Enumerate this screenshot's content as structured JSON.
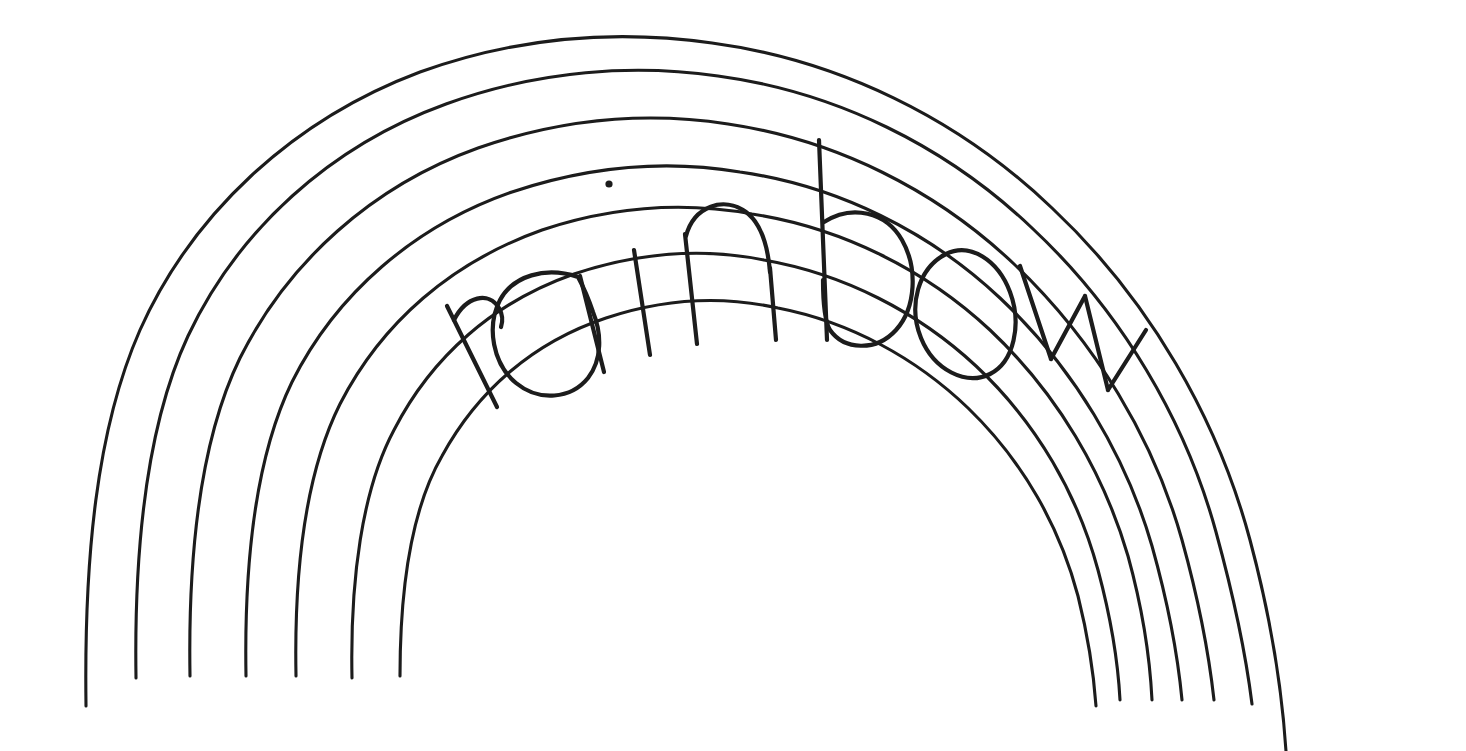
{
  "artwork": {
    "title": "rainbow",
    "kind": "hand-drawn line sketch",
    "medium": "black ink pen on white paper",
    "lettered_word": "rainbow",
    "letters": [
      "r",
      "a",
      "i",
      "n",
      "b",
      "o",
      "w"
    ],
    "letter_count": 7,
    "description": "A hand-drawn rainbow of seven concentric semicircular arcs with the word rainbow hand-lettered inside one of the bands, following the curve of the arch.",
    "background_color": "#ffffff",
    "ink_color": "#1c1c1c",
    "stroke_width_px": 3,
    "letter_stroke_width_px": 4,
    "canvas": {
      "width": 1466,
      "height": 751
    }
  },
  "rainbow": {
    "arc_count": 7,
    "center": {
      "x": 770,
      "y": 712
    },
    "arcs": [
      {
        "index": 1,
        "name": "arc-outer-1",
        "radius": 670,
        "apex_y": 43,
        "note": "outermost arc"
      },
      {
        "index": 2,
        "name": "arc-2",
        "radius": 620,
        "apex_y": 93,
        "note": ""
      },
      {
        "index": 3,
        "name": "arc-3",
        "radius": 574,
        "apex_y": 137,
        "note": "top of b ascender touches here"
      },
      {
        "index": 4,
        "name": "arc-4",
        "radius": 524,
        "apex_y": 188,
        "note": "cap line of lettering band"
      },
      {
        "index": 5,
        "name": "arc-5-letter-top",
        "radius": 476,
        "apex_y": 236,
        "note": "x-height line of lettering band"
      },
      {
        "index": 6,
        "name": "arc-6-letter-base",
        "radius": 418,
        "apex_y": 295,
        "note": "baseline of lettering band"
      },
      {
        "index": 7,
        "name": "arc-inner-7",
        "radius": 364,
        "apex_y": 348,
        "note": "innermost arc"
      }
    ],
    "lettering_band": {
      "between_arcs": [
        5,
        6
      ],
      "word": "rainbow",
      "orientation": "follows the arc curvature, letters rotate with the arch"
    },
    "artifacts": [
      {
        "name": "ink-dot",
        "x": 609,
        "y": 184,
        "radius": 3.5,
        "note": "stray pen dot above the lettering"
      }
    ]
  },
  "labels": {
    "alt_text": "Hand-drawn rainbow sketch with the word rainbow lettered inside an arc band",
    "word_label": "rainbow"
  }
}
